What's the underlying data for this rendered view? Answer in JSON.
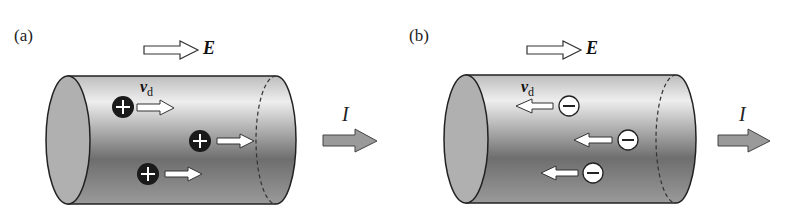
{
  "panels": [
    {
      "label": "(a)",
      "field_label": "E",
      "velocity_label": "v",
      "velocity_sub": "d",
      "current_label": "I",
      "carrier": "positive",
      "carrier_symbol": "+",
      "drift_direction": "right"
    },
    {
      "label": "(b)",
      "field_label": "E",
      "velocity_label": "v",
      "velocity_sub": "d",
      "current_label": "I",
      "carrier": "negative",
      "carrier_symbol": "−",
      "drift_direction": "left"
    }
  ],
  "colors": {
    "cylinder_light": "#e8e8e8",
    "cylinder_dark": "#6a6a6a",
    "current_arrow": "#9a9a9a",
    "positive_charge": "#1a1a1a",
    "negative_charge": "#ffffff"
  }
}
